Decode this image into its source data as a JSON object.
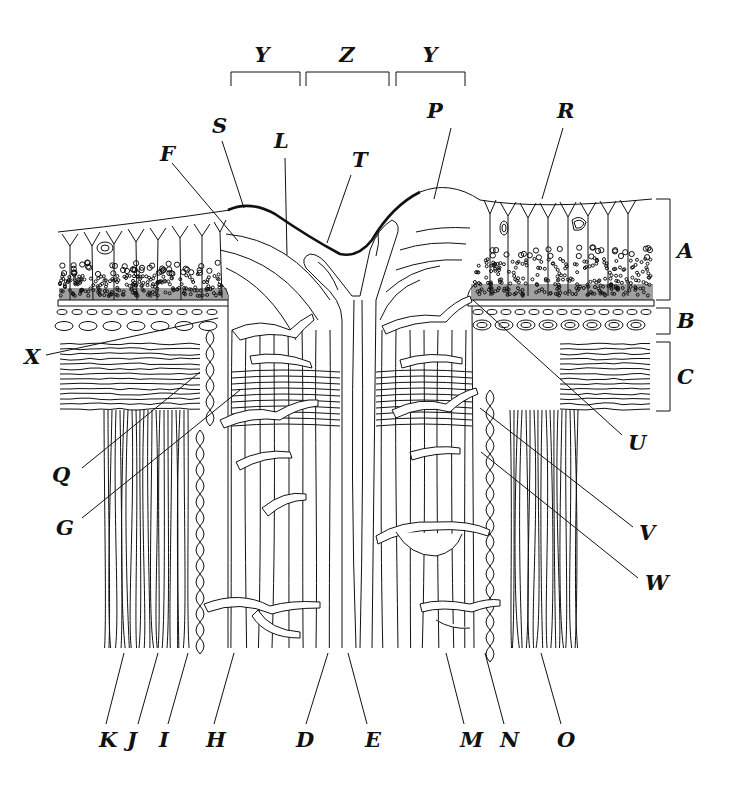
{
  "diagram": {
    "ink_color": "#111111",
    "background_color": "#ffffff",
    "top_brackets": [
      {
        "id": "Y_left",
        "label": "Y",
        "x1": 231,
        "x2": 300,
        "y": 72,
        "label_x": 262,
        "label_y": 62
      },
      {
        "id": "Z",
        "label": "Z",
        "x1": 306,
        "x2": 389,
        "y": 72,
        "label_x": 347,
        "label_y": 62
      },
      {
        "id": "Y_right",
        "label": "Y",
        "x1": 396,
        "x2": 465,
        "y": 72,
        "label_x": 430,
        "label_y": 62
      }
    ],
    "side_brackets": [
      {
        "id": "A",
        "label": "A",
        "y1": 199,
        "y2": 300,
        "x": 670,
        "label_x": 677,
        "label_y": 258
      },
      {
        "id": "B",
        "label": "B",
        "y1": 308,
        "y2": 334,
        "x": 670,
        "label_x": 677,
        "label_y": 328
      },
      {
        "id": "C",
        "label": "C",
        "y1": 342,
        "y2": 411,
        "x": 670,
        "label_x": 677,
        "label_y": 384
      }
    ],
    "labels": [
      {
        "id": "S",
        "label": "S",
        "x": 212,
        "y": 133,
        "line": [
          222,
          141,
          244,
          208
        ]
      },
      {
        "id": "F",
        "label": "F",
        "x": 160,
        "y": 161,
        "line": [
          172,
          163,
          238,
          241
        ]
      },
      {
        "id": "L",
        "label": "L",
        "x": 274,
        "y": 148,
        "line": [
          285,
          158,
          287,
          255
        ]
      },
      {
        "id": "T",
        "label": "T",
        "x": 352,
        "y": 167,
        "line": [
          351,
          175,
          327,
          243
        ]
      },
      {
        "id": "P",
        "label": "P",
        "x": 427,
        "y": 118,
        "line": [
          451,
          128,
          434,
          199
        ]
      },
      {
        "id": "R",
        "label": "R",
        "x": 557,
        "y": 118,
        "line": [
          563,
          128,
          542,
          199
        ]
      },
      {
        "id": "X",
        "label": "X",
        "x": 24,
        "y": 364,
        "line": [
          46,
          355,
          218,
          318
        ]
      },
      {
        "id": "Q",
        "label": "Q",
        "x": 52,
        "y": 482,
        "line": [
          82,
          468,
          200,
          372
        ]
      },
      {
        "id": "G",
        "label": "G",
        "x": 56,
        "y": 535,
        "line": [
          82,
          518,
          240,
          390
        ]
      },
      {
        "id": "U",
        "label": "U",
        "x": 628,
        "y": 450,
        "line": [
          622,
          435,
          473,
          300
        ]
      },
      {
        "id": "V",
        "label": "V",
        "x": 639,
        "y": 540,
        "line": [
          633,
          527,
          480,
          408
        ]
      },
      {
        "id": "W",
        "label": "W",
        "x": 645,
        "y": 590,
        "line": [
          638,
          578,
          481,
          452
        ]
      },
      {
        "id": "K",
        "label": "K",
        "x": 99,
        "y": 747,
        "line": [
          124,
          653,
          106,
          724
        ]
      },
      {
        "id": "J",
        "label": "J",
        "x": 127,
        "y": 747,
        "line": [
          158,
          653,
          138,
          724
        ]
      },
      {
        "id": "I",
        "label": "I",
        "x": 159,
        "y": 747,
        "line": [
          188,
          653,
          168,
          724
        ]
      },
      {
        "id": "H",
        "label": "H",
        "x": 206,
        "y": 747,
        "line": [
          234,
          653,
          214,
          724
        ]
      },
      {
        "id": "D",
        "label": "D",
        "x": 296,
        "y": 747,
        "line": [
          328,
          653,
          306,
          724
        ]
      },
      {
        "id": "E",
        "label": "E",
        "x": 365,
        "y": 747,
        "line": [
          348,
          653,
          367,
          724
        ]
      },
      {
        "id": "M",
        "label": "M",
        "x": 460,
        "y": 747,
        "line": [
          446,
          653,
          464,
          724
        ]
      },
      {
        "id": "N",
        "label": "N",
        "x": 500,
        "y": 747,
        "line": [
          485,
          653,
          504,
          724
        ]
      },
      {
        "id": "O",
        "label": "O",
        "x": 557,
        "y": 747,
        "line": [
          541,
          653,
          561,
          724
        ]
      }
    ]
  }
}
